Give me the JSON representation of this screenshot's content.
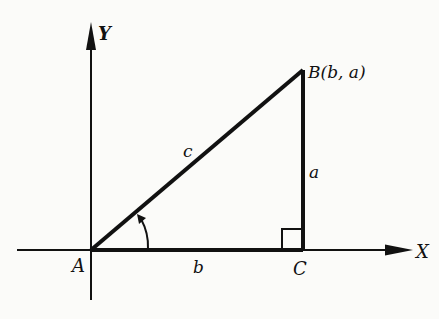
{
  "figure": {
    "type": "right-triangle-coordinate-diagram",
    "axes": {
      "x_label": "X",
      "y_label": "Y"
    },
    "vertices": {
      "A": {
        "label": "A",
        "coords": "origin"
      },
      "B": {
        "label": "B(b, a)"
      },
      "C": {
        "label": "C"
      }
    },
    "sides": {
      "hypotenuse": "c",
      "vertical": "a",
      "horizontal": "b"
    },
    "markers": {
      "right_angle_at": "C",
      "angle_arc_at": "A"
    },
    "colors": {
      "ink": "#111111",
      "background": "#fbfbf9"
    }
  }
}
